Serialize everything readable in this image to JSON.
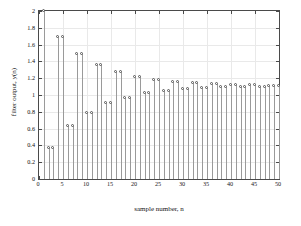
{
  "chart_data": {
    "type": "stem",
    "title": "",
    "xlabel": "sample number, n",
    "ylabel": "filter output, y(n)",
    "xlim": [
      0,
      50
    ],
    "ylim": [
      0,
      2
    ],
    "grid": true,
    "legend": null,
    "x_ticks": [
      0,
      5,
      10,
      15,
      20,
      25,
      30,
      35,
      40,
      45,
      50
    ],
    "x_tick_labels": [
      "0",
      "5",
      "10",
      "15",
      "20",
      "25",
      "30",
      "35",
      "40",
      "45",
      "50"
    ],
    "y_ticks": [
      0,
      0.2,
      0.4,
      0.6,
      0.8,
      1,
      1.2,
      1.4,
      1.6,
      1.8,
      2
    ],
    "y_tick_labels": [
      "0",
      "0.2",
      "0.4",
      "0.6",
      "0.8",
      "1",
      "1.2",
      "1.4",
      "1.6",
      "1.8",
      "2"
    ],
    "marker": "open-circle",
    "x": [
      1,
      2,
      3,
      4,
      5,
      6,
      7,
      8,
      9,
      10,
      11,
      12,
      13,
      14,
      15,
      16,
      17,
      18,
      19,
      20,
      21,
      22,
      23,
      24,
      25,
      26,
      27,
      28,
      29,
      30,
      31,
      32,
      33,
      34,
      35,
      36,
      37,
      38,
      39,
      40,
      41,
      42,
      43,
      44,
      45,
      46,
      47,
      48,
      49,
      50
    ],
    "values": [
      2.0,
      0.37,
      0.37,
      1.69,
      1.69,
      0.63,
      0.63,
      1.49,
      1.49,
      0.79,
      0.79,
      1.36,
      1.36,
      0.9,
      0.9,
      1.27,
      1.27,
      0.97,
      0.97,
      1.21,
      1.21,
      1.02,
      1.02,
      1.18,
      1.18,
      1.05,
      1.05,
      1.15,
      1.15,
      1.07,
      1.07,
      1.14,
      1.14,
      1.08,
      1.08,
      1.13,
      1.13,
      1.09,
      1.09,
      1.12,
      1.12,
      1.1,
      1.1,
      1.12,
      1.12,
      1.1,
      1.1,
      1.11,
      1.11,
      1.11
    ]
  },
  "colors": {
    "axis": "#4a4a4a",
    "grid": "#e9e9e9",
    "stem": "#9a9a9a",
    "marker_edge": "#555555",
    "background": "#ffffff",
    "text": "#111111"
  }
}
